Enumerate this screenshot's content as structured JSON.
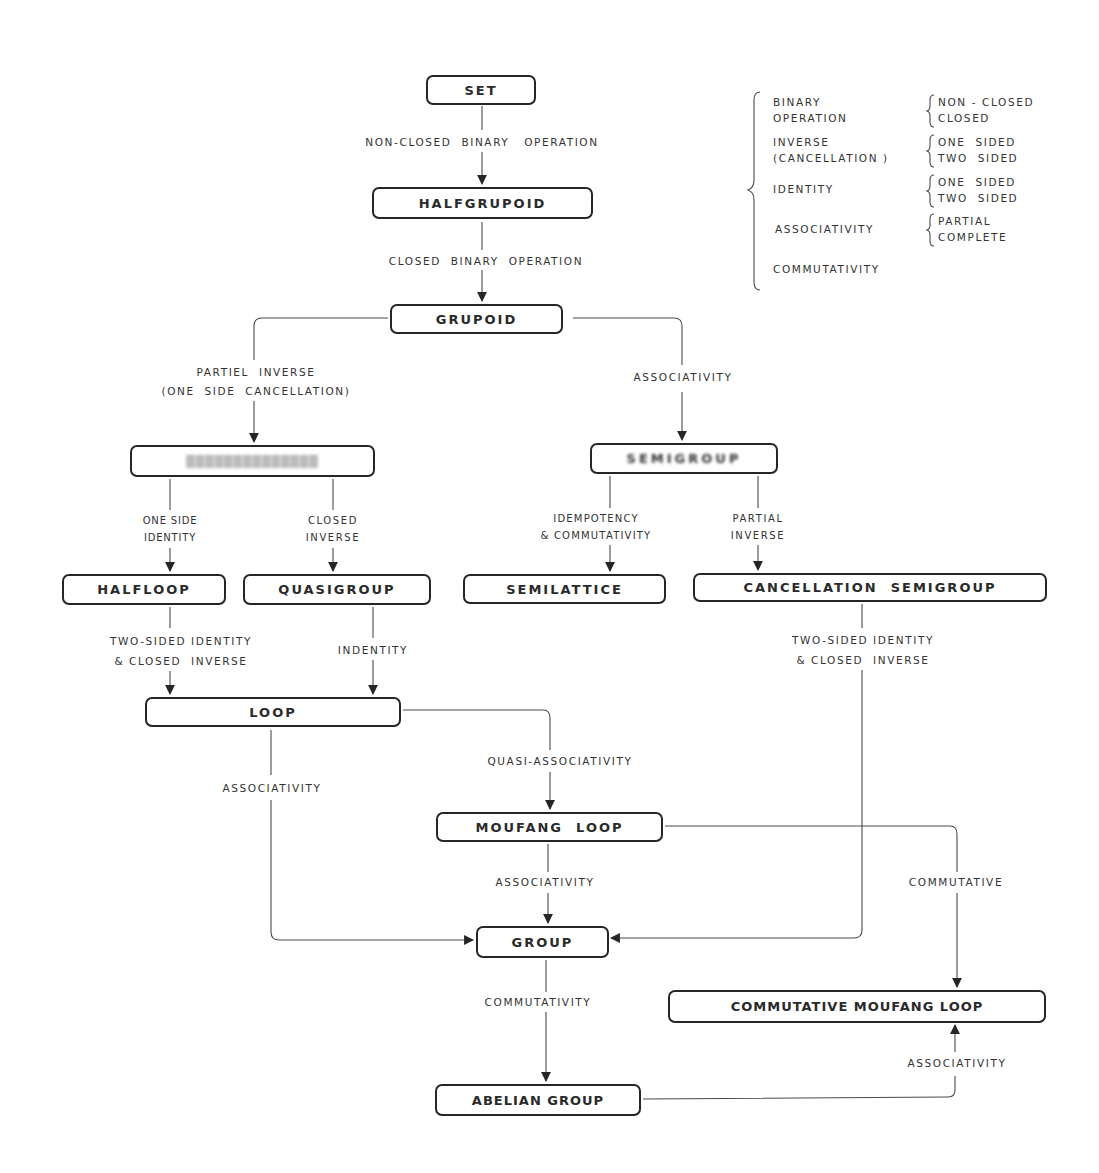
{
  "diagram": {
    "title": "",
    "nodes": {
      "set": {
        "label": "SET"
      },
      "halfgrupoid": {
        "label": "HALFGRUPOID"
      },
      "grupoid": {
        "label": "GRUPOID"
      },
      "blurred_left": {
        "label": "██████████████",
        "note": "text blurred / illegible"
      },
      "semigroup": {
        "label": "SEMIGROUP",
        "note": "partially blurred"
      },
      "halfloop": {
        "label": "HALFLOOP"
      },
      "quasigroup": {
        "label": "QUASIGROUP"
      },
      "semilattice": {
        "label": "SEMILATTICE"
      },
      "cancellation_semigroup": {
        "label": "CANCELLATION  SEMIGROUP"
      },
      "loop": {
        "label": "LOOP"
      },
      "moufang_loop": {
        "label": "MOUFANG  LOOP"
      },
      "group": {
        "label": "GROUP"
      },
      "commutative_moufang_loop": {
        "label": "COMMUTATIVE MOUFANG LOOP"
      },
      "abelian_group": {
        "label": "ABELIAN GROUP"
      }
    },
    "edges": {
      "set_halfgrupoid": {
        "label": "NON-CLOSED  BINARY   OPERATION"
      },
      "halfgrupoid_grupoid": {
        "label": "CLOSED  BINARY  OPERATION"
      },
      "grupoid_blurred": {
        "label": "PARTIEL  INVERSE\n(ONE  SIDE  CANCELLATION)"
      },
      "grupoid_semigroup": {
        "label": "ASSOCIATIVITY"
      },
      "blurred_halfloop": {
        "label": "ONE SIDE\nIDENTITY"
      },
      "blurred_quasigroup": {
        "label": "CLOSED\nINVERSE"
      },
      "semigroup_semilattice": {
        "label": "IDEMPOTENCY\n& COMMUTATIVITY"
      },
      "semigroup_cancellation": {
        "label": "PARTIAL\nINVERSE"
      },
      "halfloop_loop": {
        "label": "TWO-SIDED IDENTITY\n& CLOSED  INVERSE"
      },
      "quasigroup_loop": {
        "label": "INDENTITY"
      },
      "cancellation_group": {
        "label": "TWO-SIDED IDENTITY\n& CLOSED  INVERSE"
      },
      "loop_moufang": {
        "label": "QUASI-ASSOCIATIVITY"
      },
      "loop_group": {
        "label": "ASSOCIATIVITY"
      },
      "moufang_group": {
        "label": "ASSOCIATIVITY"
      },
      "moufang_commutative": {
        "label": "COMMUTATIVE"
      },
      "group_abelian": {
        "label": "COMMUTATIVITY"
      },
      "abelian_commutative": {
        "label": "ASSOCIATIVITY"
      }
    }
  },
  "legend": {
    "rows": [
      {
        "property": "BINARY\nOPERATION",
        "options": "NON - CLOSED\nCLOSED"
      },
      {
        "property": "INVERSE\n(CANCELLATION )",
        "options": "ONE  SIDED\nTWO  SIDED"
      },
      {
        "property": "IDENTITY",
        "options": "ONE  SIDED\nTWO  SIDED"
      },
      {
        "property": "ASSOCIATIVITY",
        "options": "PARTIAL\nCOMPLETE"
      },
      {
        "property": "COMMUTATIVITY",
        "options": ""
      }
    ]
  },
  "colors": {
    "ink": "#262626",
    "background": "#ffffff"
  }
}
